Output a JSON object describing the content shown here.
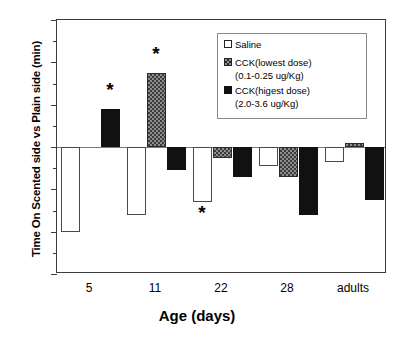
{
  "chart_data": {
    "type": "bar",
    "title": "",
    "xlabel": "Age (days)",
    "ylabel": "Time On Scented side vs Plain side (min)",
    "categories": [
      "5",
      "11",
      "22",
      "28",
      "adults"
    ],
    "ylim": [
      -6,
      6
    ],
    "yticks": [
      6,
      4,
      2,
      0,
      -2,
      -4,
      -6
    ],
    "ytick_labels": [
      "6",
      "4",
      "2",
      "0",
      "-2",
      "-4",
      "-6"
    ],
    "minor_yticks": [
      5,
      3,
      1,
      -1,
      -3,
      -5
    ],
    "grid": false,
    "legend_position": "top-right",
    "zero_reference_line": true,
    "series": [
      {
        "name": "Saline",
        "fill": "open",
        "values": [
          -4.0,
          -3.2,
          -2.6,
          -0.9,
          -0.7
        ]
      },
      {
        "name": "CCK(lowest dose) (0.1-0.25 ug/Kg)",
        "fill": "checkered-gray",
        "values": [
          null,
          3.5,
          -0.5,
          -1.4,
          0.2
        ]
      },
      {
        "name": "CCK(higest dose) (2.0-3.6 ug/Kg)",
        "fill": "solid-black",
        "values": [
          1.8,
          -1.1,
          -1.4,
          -3.2,
          -2.5
        ]
      }
    ],
    "annotations": [
      {
        "text": "*",
        "category": "5",
        "series": "CCK(higest dose)",
        "y": 2.7
      },
      {
        "text": "*",
        "category": "11",
        "series": "CCK(lowest dose)",
        "y": 4.4
      },
      {
        "text": "*",
        "category": "22",
        "series": "Saline",
        "y": -3.1
      }
    ]
  },
  "legend": {
    "items": [
      {
        "label": "Saline",
        "sublabel": ""
      },
      {
        "label": "CCK(lowest dose)",
        "sublabel": "(0.1-0.25 ug/Kg)"
      },
      {
        "label": "CCK(higest dose)",
        "sublabel": "(2.0-3.6 ug/Kg)"
      }
    ]
  }
}
